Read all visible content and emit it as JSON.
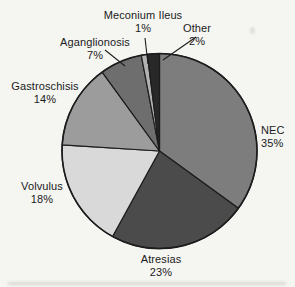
{
  "page": {
    "background_color": "#f5f5f2",
    "text_color": "#1b1b1b"
  },
  "chart_data": {
    "type": "pie",
    "unit": "%",
    "start_angle": "12-oclock",
    "direction": "clockwise",
    "outline_color": "#1c1c1c",
    "legend_position": "none",
    "labels_style": "outside-with-leader-lines",
    "slices": [
      {
        "id": "nec",
        "label": "NEC",
        "value": 35,
        "pct_label": "35%",
        "color": "#7d7d7d"
      },
      {
        "id": "atresias",
        "label": "Atresias",
        "value": 23,
        "pct_label": "23%",
        "color": "#4b4b4b"
      },
      {
        "id": "volvulus",
        "label": "Volvulus",
        "value": 18,
        "pct_label": "18%",
        "color": "#d9d9d9"
      },
      {
        "id": "gastroschisis",
        "label": "Gastroschisis",
        "value": 14,
        "pct_label": "14%",
        "color": "#9c9c9c"
      },
      {
        "id": "aganglionosis",
        "label": "Aganglionosis",
        "value": 7,
        "pct_label": "7%",
        "color": "#6e6e6e"
      },
      {
        "id": "meconium-ileus",
        "label": "Meconium Ileus",
        "value": 1,
        "pct_label": "1%",
        "color": "#b2b2b2"
      },
      {
        "id": "other",
        "label": "Other",
        "value": 2,
        "pct_label": "2%",
        "color": "#282828"
      }
    ]
  }
}
